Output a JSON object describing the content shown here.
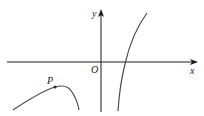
{
  "figure": {
    "type": "function-graph",
    "axes": {
      "x_label": "x",
      "y_label": "y",
      "origin_label": "O"
    },
    "points": [
      {
        "label": "P",
        "description": "marked point on left branch near its local maximum"
      }
    ],
    "curves": [
      {
        "name": "left-branch",
        "description": "curve in third quadrant rising to local maximum near P then descending"
      },
      {
        "name": "right-branch",
        "description": "increasing curve crossing positive x-axis, asymptotic downward near y-axis"
      }
    ],
    "colors": {
      "axes": "#1a1a1a",
      "curves": "#4a4a4a",
      "background": "#ffffff"
    }
  }
}
